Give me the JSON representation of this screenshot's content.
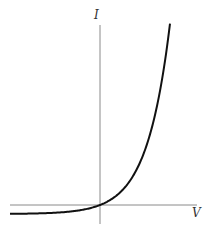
{
  "chart_data": {
    "type": "line",
    "title": "",
    "xlabel": "V",
    "ylabel": "I",
    "grid": false,
    "legend": null,
    "series": [
      {
        "name": "I(V)",
        "formula": "I = I_s (e^{kV} - 1)",
        "points_px": [
          [
            10,
            214
          ],
          [
            40,
            213.3
          ],
          [
            70,
            211.3
          ],
          [
            85,
            209.5
          ],
          [
            100,
            205
          ],
          [
            115,
            199
          ],
          [
            130,
            172
          ],
          [
            145,
            138
          ],
          [
            160,
            73
          ],
          [
            170,
            24
          ]
        ]
      }
    ],
    "axes": {
      "origin_px": [
        100,
        205
      ],
      "x_axis_px": [
        10,
        197
      ],
      "y_axis_px": [
        25,
        224
      ]
    },
    "colors": {
      "curve": "#111111",
      "axis": "#888888",
      "label": "#333333"
    }
  },
  "labels": {
    "x_axis": "V",
    "y_axis": "I"
  }
}
